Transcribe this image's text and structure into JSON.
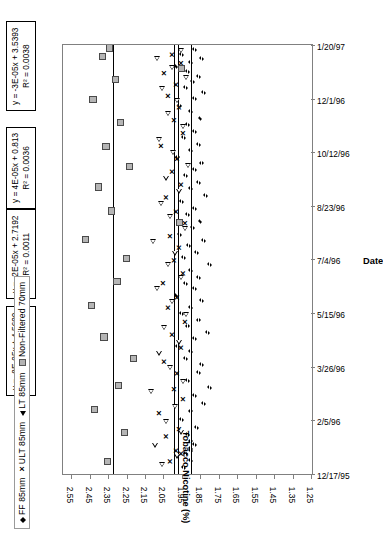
{
  "chart_data": {
    "type": "scatter",
    "title": "",
    "xlabel": "Date",
    "ylabel": "Tobacco Nicotine (%)",
    "ylim": [
      1.25,
      2.6
    ],
    "yticks": [
      "2.55",
      "2.45",
      "2.35",
      "2.25",
      "2.15",
      "2.05",
      "1.95",
      "1.85",
      "1.75",
      "1.65",
      "1.55",
      "1.45",
      "1.35",
      "1.25"
    ],
    "xticks": [
      "12/17/95",
      "2/5/96",
      "3/26/96",
      "5/15/96",
      "7/4/96",
      "8/23/96",
      "10/12/96",
      "12/1/96",
      "1/20/97"
    ],
    "grid": false,
    "legend_position": "top-left",
    "series": [
      {
        "name": "FF 85mm",
        "marker": "diamond",
        "trendline": {
          "equation": "y = -8E-05x + 4.5699",
          "r2": "R² = 0.0126",
          "y_const": 1.905
        },
        "points": [
          {
            "x": 0.018,
            "y": 1.94
          },
          {
            "x": 0.035,
            "y": 1.9
          },
          {
            "x": 0.05,
            "y": 1.93
          },
          {
            "x": 0.058,
            "y": 1.9
          },
          {
            "x": 0.062,
            "y": 1.9
          },
          {
            "x": 0.072,
            "y": 1.88
          },
          {
            "x": 0.08,
            "y": 1.9
          },
          {
            "x": 0.095,
            "y": 1.92
          },
          {
            "x": 0.112,
            "y": 1.87
          },
          {
            "x": 0.13,
            "y": 1.95
          },
          {
            "x": 0.15,
            "y": 1.9
          },
          {
            "x": 0.168,
            "y": 1.83
          },
          {
            "x": 0.186,
            "y": 1.88
          },
          {
            "x": 0.205,
            "y": 1.8
          },
          {
            "x": 0.222,
            "y": 1.92
          },
          {
            "x": 0.24,
            "y": 1.86
          },
          {
            "x": 0.258,
            "y": 1.84
          },
          {
            "x": 0.272,
            "y": 1.93
          },
          {
            "x": 0.288,
            "y": 1.9
          },
          {
            "x": 0.3,
            "y": 1.97
          },
          {
            "x": 0.318,
            "y": 1.88
          },
          {
            "x": 0.332,
            "y": 1.81
          },
          {
            "x": 0.348,
            "y": 1.92
          },
          {
            "x": 0.362,
            "y": 1.86
          },
          {
            "x": 0.378,
            "y": 1.95
          },
          {
            "x": 0.392,
            "y": 1.9
          },
          {
            "x": 0.408,
            "y": 1.84
          },
          {
            "x": 0.42,
            "y": 1.98
          },
          {
            "x": 0.435,
            "y": 1.88
          },
          {
            "x": 0.448,
            "y": 1.93
          },
          {
            "x": 0.462,
            "y": 1.86
          },
          {
            "x": 0.478,
            "y": 1.9
          },
          {
            "x": 0.492,
            "y": 1.8
          },
          {
            "x": 0.508,
            "y": 1.94
          },
          {
            "x": 0.52,
            "y": 1.87
          },
          {
            "x": 0.535,
            "y": 1.91
          },
          {
            "x": 0.548,
            "y": 1.83
          },
          {
            "x": 0.562,
            "y": 1.96
          },
          {
            "x": 0.578,
            "y": 1.89
          },
          {
            "x": 0.592,
            "y": 1.85
          },
          {
            "x": 0.608,
            "y": 1.92
          },
          {
            "x": 0.622,
            "y": 1.88
          },
          {
            "x": 0.638,
            "y": 1.95
          },
          {
            "x": 0.652,
            "y": 1.82
          },
          {
            "x": 0.668,
            "y": 1.9
          },
          {
            "x": 0.682,
            "y": 1.86
          },
          {
            "x": 0.698,
            "y": 1.93
          },
          {
            "x": 0.712,
            "y": 1.88
          },
          {
            "x": 0.728,
            "y": 1.84
          },
          {
            "x": 0.742,
            "y": 1.97
          },
          {
            "x": 0.758,
            "y": 1.9
          },
          {
            "x": 0.772,
            "y": 1.86
          },
          {
            "x": 0.788,
            "y": 1.94
          },
          {
            "x": 0.802,
            "y": 1.88
          },
          {
            "x": 0.818,
            "y": 1.92
          },
          {
            "x": 0.832,
            "y": 1.85
          },
          {
            "x": 0.848,
            "y": 1.9
          },
          {
            "x": 0.862,
            "y": 1.96
          },
          {
            "x": 0.878,
            "y": 1.88
          },
          {
            "x": 0.892,
            "y": 1.83
          },
          {
            "x": 0.905,
            "y": 1.93
          },
          {
            "x": 0.918,
            "y": 1.89
          },
          {
            "x": 0.93,
            "y": 1.86
          },
          {
            "x": 0.942,
            "y": 1.92
          },
          {
            "x": 0.952,
            "y": 1.98
          },
          {
            "x": 0.962,
            "y": 1.9
          },
          {
            "x": 0.972,
            "y": 1.84
          },
          {
            "x": 0.982,
            "y": 1.95
          },
          {
            "x": 0.992,
            "y": 1.88
          }
        ]
      },
      {
        "name": "ULT 85mm",
        "marker": "x",
        "trendline": {
          "equation": "y = -2E-05x + 2.7192",
          "r2": "R² = 0.0011",
          "y_const": 1.975
        },
        "points": [
          {
            "x": 0.03,
            "y": 2.02
          },
          {
            "x": 0.048,
            "y": 1.96
          },
          {
            "x": 0.055,
            "y": 1.99
          },
          {
            "x": 0.088,
            "y": 2.04
          },
          {
            "x": 0.105,
            "y": 1.97
          },
          {
            "x": 0.142,
            "y": 2.08
          },
          {
            "x": 0.175,
            "y": 1.95
          },
          {
            "x": 0.198,
            "y": 2.0
          },
          {
            "x": 0.235,
            "y": 1.98
          },
          {
            "x": 0.262,
            "y": 2.05
          },
          {
            "x": 0.295,
            "y": 1.96
          },
          {
            "x": 0.325,
            "y": 2.01
          },
          {
            "x": 0.355,
            "y": 1.94
          },
          {
            "x": 0.388,
            "y": 2.03
          },
          {
            "x": 0.412,
            "y": 1.98
          },
          {
            "x": 0.445,
            "y": 2.06
          },
          {
            "x": 0.468,
            "y": 1.95
          },
          {
            "x": 0.498,
            "y": 2.0
          },
          {
            "x": 0.528,
            "y": 1.97
          },
          {
            "x": 0.555,
            "y": 2.02
          },
          {
            "x": 0.585,
            "y": 1.94
          },
          {
            "x": 0.612,
            "y": 1.99
          },
          {
            "x": 0.645,
            "y": 2.04
          },
          {
            "x": 0.675,
            "y": 1.96
          },
          {
            "x": 0.705,
            "y": 2.01
          },
          {
            "x": 0.735,
            "y": 1.98
          },
          {
            "x": 0.765,
            "y": 2.07
          },
          {
            "x": 0.795,
            "y": 1.95
          },
          {
            "x": 0.825,
            "y": 2.0
          },
          {
            "x": 0.855,
            "y": 1.97
          },
          {
            "x": 0.882,
            "y": 2.03
          },
          {
            "x": 0.908,
            "y": 1.99
          },
          {
            "x": 0.935,
            "y": 2.05
          },
          {
            "x": 0.958,
            "y": 1.96
          },
          {
            "x": 0.978,
            "y": 2.01
          }
        ]
      },
      {
        "name": "LT 85mm",
        "marker": "triangle",
        "trendline": {
          "equation": "y = 4E-05x + 0.813",
          "r2": "R² = 0.0036",
          "y_const": 2.0
        },
        "points": [
          {
            "x": 0.022,
            "y": 2.06
          },
          {
            "x": 0.042,
            "y": 1.98
          },
          {
            "x": 0.068,
            "y": 2.1
          },
          {
            "x": 0.098,
            "y": 1.96
          },
          {
            "x": 0.122,
            "y": 2.04
          },
          {
            "x": 0.158,
            "y": 1.99
          },
          {
            "x": 0.192,
            "y": 2.12
          },
          {
            "x": 0.215,
            "y": 1.95
          },
          {
            "x": 0.248,
            "y": 2.02
          },
          {
            "x": 0.282,
            "y": 2.08
          },
          {
            "x": 0.308,
            "y": 1.97
          },
          {
            "x": 0.342,
            "y": 2.05
          },
          {
            "x": 0.372,
            "y": 1.93
          },
          {
            "x": 0.402,
            "y": 2.01
          },
          {
            "x": 0.432,
            "y": 2.09
          },
          {
            "x": 0.458,
            "y": 1.96
          },
          {
            "x": 0.488,
            "y": 2.03
          },
          {
            "x": 0.515,
            "y": 1.99
          },
          {
            "x": 0.542,
            "y": 2.11
          },
          {
            "x": 0.572,
            "y": 1.94
          },
          {
            "x": 0.6,
            "y": 2.02
          },
          {
            "x": 0.63,
            "y": 2.07
          },
          {
            "x": 0.66,
            "y": 1.97
          },
          {
            "x": 0.69,
            "y": 2.04
          },
          {
            "x": 0.72,
            "y": 1.92
          },
          {
            "x": 0.75,
            "y": 2.0
          },
          {
            "x": 0.78,
            "y": 2.08
          },
          {
            "x": 0.81,
            "y": 1.95
          },
          {
            "x": 0.84,
            "y": 2.03
          },
          {
            "x": 0.87,
            "y": 1.98
          },
          {
            "x": 0.898,
            "y": 2.06
          },
          {
            "x": 0.925,
            "y": 1.93
          },
          {
            "x": 0.948,
            "y": 2.01
          },
          {
            "x": 0.968,
            "y": 2.09
          },
          {
            "x": 0.988,
            "y": 1.96
          }
        ]
      },
      {
        "name": "Non-Filtered 70mm",
        "marker": "square",
        "trendline": {
          "equation": "y = -3E-05x + 3.5393",
          "r2": "R² = 0.0038",
          "y_const": 2.33
        },
        "points": [
          {
            "x": 0.028,
            "y": 2.36
          },
          {
            "x": 0.095,
            "y": 2.27
          },
          {
            "x": 0.15,
            "y": 2.43
          },
          {
            "x": 0.205,
            "y": 2.3
          },
          {
            "x": 0.268,
            "y": 2.22
          },
          {
            "x": 0.318,
            "y": 2.38
          },
          {
            "x": 0.392,
            "y": 2.45
          },
          {
            "x": 0.448,
            "y": 2.31
          },
          {
            "x": 0.502,
            "y": 2.26
          },
          {
            "x": 0.545,
            "y": 2.48
          },
          {
            "x": 0.585,
            "y": 1.97
          },
          {
            "x": 0.612,
            "y": 2.34
          },
          {
            "x": 0.668,
            "y": 2.41
          },
          {
            "x": 0.715,
            "y": 2.24
          },
          {
            "x": 0.762,
            "y": 2.37
          },
          {
            "x": 0.818,
            "y": 2.29
          },
          {
            "x": 0.872,
            "y": 2.44
          },
          {
            "x": 0.918,
            "y": 2.32
          },
          {
            "x": 0.945,
            "y": 1.96
          },
          {
            "x": 0.972,
            "y": 2.39
          },
          {
            "x": 0.992,
            "y": 2.35
          }
        ]
      }
    ]
  },
  "legend": {
    "items": [
      {
        "marker": "diamond-marker",
        "label": "FF 85mm"
      },
      {
        "marker": "x-marker",
        "label": "ULT 85mm"
      },
      {
        "marker": "triangle-marker",
        "label": "LT 85mm"
      },
      {
        "marker": "square-marker",
        "label": "Non-Filtered 70mm"
      }
    ],
    "x_glyph": "×"
  },
  "equation_boxes": [
    {
      "equation": "y = -3E-05x + 3.5393",
      "r2": "R² = 0.0038"
    },
    {
      "equation": "y = 4E-05x + 0.813",
      "r2": "R² = 0.0036"
    },
    {
      "equation": "y = -2E-05x + 2.7192",
      "r2": "R² = 0.0011"
    },
    {
      "equation": "y = -8E-05x + 4.5699",
      "r2": "R² = 0.0126"
    }
  ]
}
